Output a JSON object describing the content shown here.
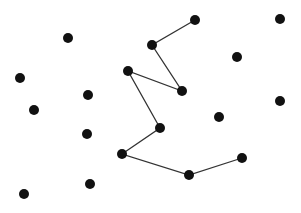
{
  "canvas": {
    "width": 301,
    "height": 213,
    "background": "#ffffff"
  },
  "style": {
    "dot_color": "#111111",
    "dot_radius": 5,
    "line_color": "#333333",
    "line_width": 1.3
  },
  "points": [
    {
      "x": 68,
      "y": 38
    },
    {
      "x": 20,
      "y": 78
    },
    {
      "x": 34,
      "y": 110
    },
    {
      "x": 88,
      "y": 95
    },
    {
      "x": 87,
      "y": 134
    },
    {
      "x": 24,
      "y": 194
    },
    {
      "x": 90,
      "y": 184
    },
    {
      "x": 237,
      "y": 57
    },
    {
      "x": 280,
      "y": 19
    },
    {
      "x": 280,
      "y": 101
    },
    {
      "x": 219,
      "y": 117
    }
  ],
  "path": [
    {
      "x": 195,
      "y": 20
    },
    {
      "x": 152,
      "y": 45
    },
    {
      "x": 182,
      "y": 91
    },
    {
      "x": 128,
      "y": 71
    },
    {
      "x": 160,
      "y": 128
    },
    {
      "x": 122,
      "y": 154
    },
    {
      "x": 189,
      "y": 175
    },
    {
      "x": 242,
      "y": 158
    }
  ]
}
